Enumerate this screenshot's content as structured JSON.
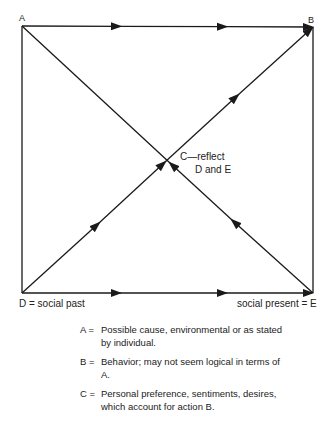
{
  "diagram": {
    "corners": {
      "A": "A",
      "B": "B"
    },
    "bottom_left_label": "D = social past",
    "bottom_right_label": "social present = E",
    "center_label_line1": "C—reflect",
    "center_label_line2": "D and E",
    "edges": [
      {
        "from": "A",
        "to": "B",
        "arrows": 3
      },
      {
        "from": "D",
        "to": "E",
        "arrows": 3
      },
      {
        "from": "D",
        "to": "B",
        "arrows": 4
      },
      {
        "from": "E",
        "to": "A",
        "arrows": 2
      },
      {
        "from": "A",
        "to": "D",
        "arrows": 0
      },
      {
        "from": "B",
        "to": "E",
        "arrows": 0
      }
    ]
  },
  "legend": [
    {
      "key": "A =",
      "text": "Possible cause, environmental or as stated by individual."
    },
    {
      "key": "B =",
      "text": "Behavior; may not seem logical in terms of A."
    },
    {
      "key": "C =",
      "text": "Personal preference, sentiments, desires, which account for action B."
    }
  ],
  "colors": {
    "line": "#1a1a1a",
    "background": "#ffffff"
  }
}
